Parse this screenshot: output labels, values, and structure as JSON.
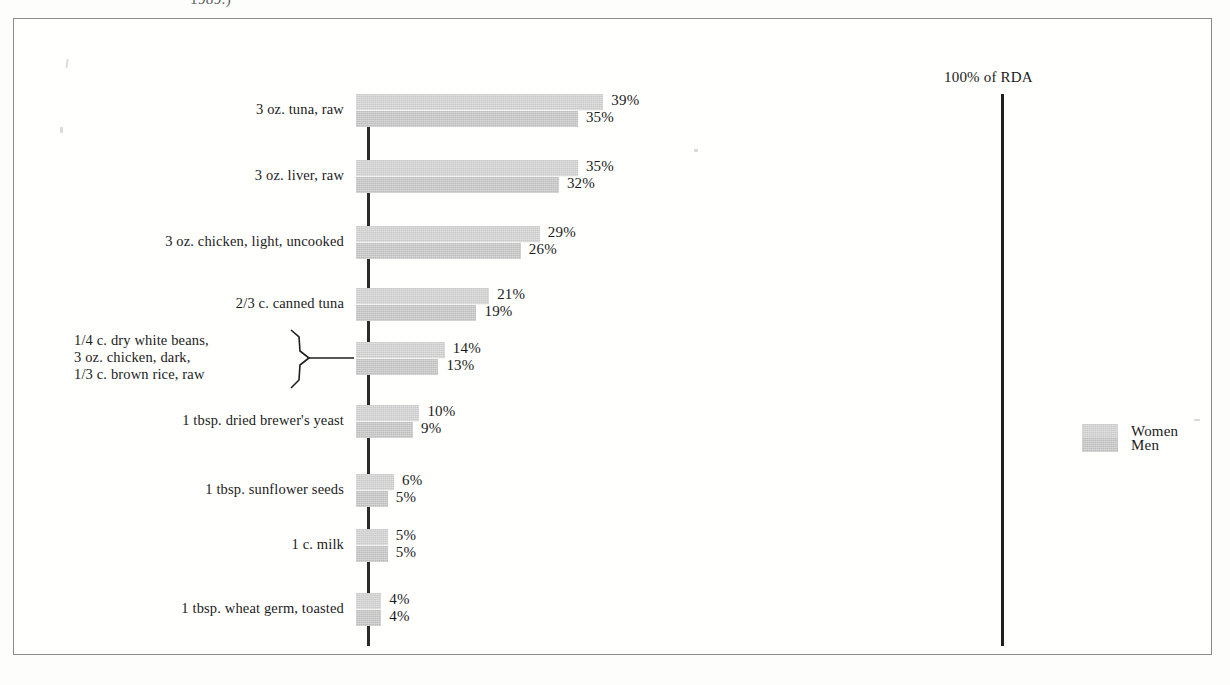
{
  "caption_fragment": "1989.)",
  "rda_marker": {
    "label": "100% of RDA",
    "value": 100
  },
  "legend": {
    "items": [
      {
        "label": "Women",
        "color": "#c9c9c9"
      },
      {
        "label": "Men",
        "color": "#bcbcbc"
      }
    ]
  },
  "chart_data": {
    "type": "bar",
    "orientation": "horizontal",
    "title": "",
    "subtitle": "",
    "xlabel": "",
    "ylabel": "",
    "xlim": [
      0,
      100
    ],
    "grid": false,
    "legend_position": "right",
    "value_suffix": "%",
    "annotations": [
      {
        "text": "100% of RDA",
        "x": 100
      },
      {
        "text": "1989.)",
        "note": "cut-off caption above figure frame"
      }
    ],
    "categories": [
      "3 oz. tuna, raw",
      "3 oz. liver, raw",
      "3 oz. chicken, light, uncooked",
      "2/3 c. canned tuna",
      "1/4 c. dry white beans,\n3 oz. chicken, dark,\n1/3 c. brown rice, raw",
      "1 tbsp. dried brewer's yeast",
      "1 tbsp. sunflower seeds",
      "1 c. milk",
      "1 tbsp. wheat germ, toasted"
    ],
    "series": [
      {
        "name": "Women",
        "values": [
          39,
          35,
          29,
          21,
          14,
          10,
          6,
          5,
          4
        ]
      },
      {
        "name": "Men",
        "values": [
          35,
          32,
          26,
          19,
          13,
          9,
          5,
          5,
          4
        ]
      }
    ]
  },
  "rows": [
    {
      "label_lines": [
        "3 oz. tuna, raw"
      ],
      "women": {
        "value": 39,
        "text": "39%"
      },
      "men": {
        "value": 35,
        "text": "35%"
      },
      "braced": false
    },
    {
      "label_lines": [
        "3 oz. liver, raw"
      ],
      "women": {
        "value": 35,
        "text": "35%"
      },
      "men": {
        "value": 32,
        "text": "32%"
      },
      "braced": false
    },
    {
      "label_lines": [
        "3 oz. chicken, light, uncooked"
      ],
      "women": {
        "value": 29,
        "text": "29%"
      },
      "men": {
        "value": 26,
        "text": "26%"
      },
      "braced": false
    },
    {
      "label_lines": [
        "2/3 c. canned tuna"
      ],
      "women": {
        "value": 21,
        "text": "21%"
      },
      "men": {
        "value": 19,
        "text": "19%"
      },
      "braced": false
    },
    {
      "label_lines": [
        "1/4 c. dry white beans,",
        "3 oz. chicken, dark,",
        "1/3 c. brown rice, raw"
      ],
      "women": {
        "value": 14,
        "text": "14%"
      },
      "men": {
        "value": 13,
        "text": "13%"
      },
      "braced": true
    },
    {
      "label_lines": [
        "1 tbsp. dried brewer's yeast"
      ],
      "women": {
        "value": 10,
        "text": "10%"
      },
      "men": {
        "value": 9,
        "text": "9%"
      },
      "braced": false
    },
    {
      "label_lines": [
        "1 tbsp. sunflower seeds"
      ],
      "women": {
        "value": 6,
        "text": "6%"
      },
      "men": {
        "value": 5,
        "text": "5%"
      },
      "braced": false
    },
    {
      "label_lines": [
        "1 c. milk"
      ],
      "women": {
        "value": 5,
        "text": "5%"
      },
      "men": {
        "value": 5,
        "text": "5%"
      },
      "braced": false
    },
    {
      "label_lines": [
        "1 tbsp. wheat germ, toasted"
      ],
      "women": {
        "value": 4,
        "text": "4%"
      },
      "men": {
        "value": 4,
        "text": "4%"
      },
      "braced": false
    }
  ]
}
